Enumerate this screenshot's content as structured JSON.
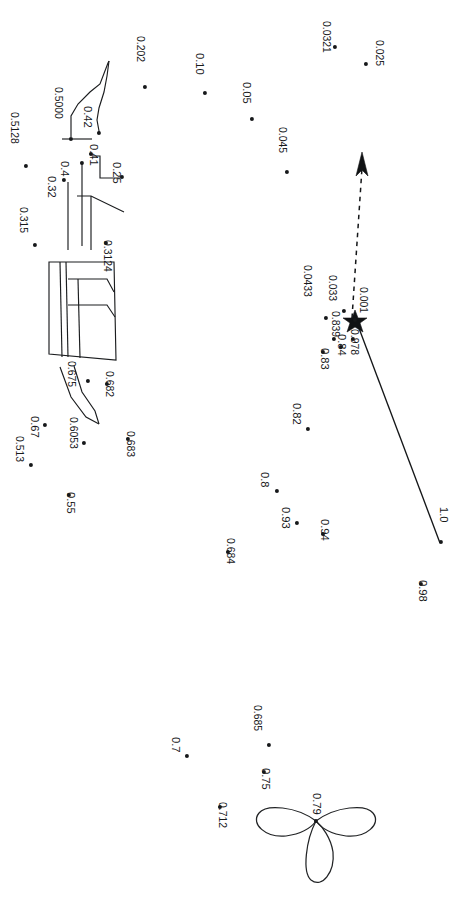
{
  "figure": {
    "title": "",
    "background_color": "#ffffff",
    "ink_color": "#18191b",
    "orientation_note": "labels rotated 90 degrees clockwise",
    "width": 476,
    "height": 899
  },
  "chart_data": {
    "type": "scatter",
    "title": "",
    "xlabel": "",
    "ylabel": "",
    "grid": false,
    "legend": null,
    "point_labels": [
      "0.025",
      "0.0321",
      "0.202",
      "0.10",
      "0.05",
      "0.045",
      "0.5000",
      "0.5128",
      "0.42",
      "0.41",
      "0.4",
      "0.32",
      "0.25",
      "0.315",
      "0.3124",
      "0.0433",
      "0.033",
      "0.001",
      "0.978",
      "0.84",
      "0.839",
      "0.83",
      "0.82",
      "0.8",
      "0.93",
      "0.94",
      "1.0",
      "0.98",
      "0.675",
      "0.682",
      "0.67",
      "0.6053",
      "0.513",
      "0.55",
      "0.683",
      "0.684",
      "0.685",
      "0.7",
      "0.75",
      "0.712",
      "0.79"
    ],
    "points": [
      {
        "label": "0.025",
        "x": 366,
        "y": 64,
        "lx": 384,
        "ly": 40
      },
      {
        "label": "0.0321",
        "x": 335,
        "y": 47,
        "lx": 331,
        "ly": 21
      },
      {
        "label": "0.202",
        "x": 145,
        "y": 87,
        "lx": 145,
        "ly": 36
      },
      {
        "label": "0.10",
        "x": 205,
        "y": 93,
        "lx": 205,
        "ly": 53
      },
      {
        "label": "0.05",
        "x": 252,
        "y": 119,
        "lx": 252,
        "ly": 82
      },
      {
        "label": "0.045",
        "x": 287,
        "y": 172,
        "lx": 287,
        "ly": 127
      },
      {
        "label": "0.5000",
        "x": 71,
        "y": 139,
        "lx": 63,
        "ly": 87
      },
      {
        "label": "0.5128",
        "x": 26,
        "y": 166,
        "lx": 19,
        "ly": 112
      },
      {
        "label": "0.42",
        "x": 99,
        "y": 133,
        "lx": 93,
        "ly": 106
      },
      {
        "label": "0.41",
        "x": 91,
        "y": 154,
        "lx": 99,
        "ly": 144
      },
      {
        "label": "0.4",
        "x": 82,
        "y": 163,
        "lx": 70,
        "ly": 161
      },
      {
        "label": "0.32",
        "x": 64,
        "y": 180,
        "lx": 57,
        "ly": 176
      },
      {
        "label": "0.25",
        "x": 122,
        "y": 177,
        "lx": 122,
        "ly": 162
      },
      {
        "label": "0.315",
        "x": 35,
        "y": 245,
        "lx": 28,
        "ly": 207
      },
      {
        "label": "0.3124",
        "x": 106,
        "y": 243,
        "lx": 112,
        "ly": 240
      },
      {
        "label": "0.0433",
        "x": 326,
        "y": 318,
        "lx": 312,
        "ly": 265
      },
      {
        "label": "0.033",
        "x": 344,
        "y": 311,
        "lx": 337,
        "ly": 275
      },
      {
        "label": "0.001",
        "x": 355,
        "y": 320,
        "lx": 368,
        "ly": 287
      },
      {
        "label": "0.978",
        "x": 353,
        "y": 339,
        "lx": 359,
        "ly": 329
      },
      {
        "label": "0.84",
        "x": 341,
        "y": 347,
        "lx": 347,
        "ly": 334
      },
      {
        "label": "0.839",
        "x": 334,
        "y": 339,
        "lx": 340,
        "ly": 311
      },
      {
        "label": "0.83",
        "x": 323,
        "y": 352,
        "lx": 330,
        "ly": 348
      },
      {
        "label": "0.82",
        "x": 308,
        "y": 429,
        "lx": 302,
        "ly": 403
      },
      {
        "label": "0.8",
        "x": 277,
        "y": 491,
        "lx": 270,
        "ly": 472
      },
      {
        "label": "0.93",
        "x": 297,
        "y": 523,
        "lx": 291,
        "ly": 507
      },
      {
        "label": "0.94",
        "x": 323,
        "y": 534,
        "lx": 330,
        "ly": 519
      },
      {
        "label": "1.0",
        "x": 441,
        "y": 542,
        "lx": 449,
        "ly": 507
      },
      {
        "label": "0.98",
        "x": 421,
        "y": 584,
        "lx": 428,
        "ly": 580
      },
      {
        "label": "0.675",
        "x": 88,
        "y": 381,
        "lx": 76,
        "ly": 361
      },
      {
        "label": "0.682",
        "x": 107,
        "y": 384,
        "lx": 114,
        "ly": 371
      },
      {
        "label": "0.67",
        "x": 45,
        "y": 425,
        "lx": 40,
        "ly": 416
      },
      {
        "label": "0.6053",
        "x": 84,
        "y": 443,
        "lx": 78,
        "ly": 417
      },
      {
        "label": "0.513",
        "x": 31,
        "y": 465,
        "lx": 24,
        "ly": 436
      },
      {
        "label": "0.55",
        "x": 69,
        "y": 495,
        "lx": 76,
        "ly": 492
      },
      {
        "label": "0.683",
        "x": 128,
        "y": 439,
        "lx": 135,
        "ly": 431
      },
      {
        "label": "0.684",
        "x": 228,
        "y": 552,
        "lx": 235,
        "ly": 538
      },
      {
        "label": "0.685",
        "x": 269,
        "y": 745,
        "lx": 262,
        "ly": 705
      },
      {
        "label": "0.7",
        "x": 187,
        "y": 756,
        "lx": 181,
        "ly": 737
      },
      {
        "label": "0.75",
        "x": 264,
        "y": 772,
        "lx": 271,
        "ly": 768
      },
      {
        "label": "0.712",
        "x": 220,
        "y": 807,
        "lx": 227,
        "ly": 802
      },
      {
        "label": "0.79",
        "x": 316,
        "y": 821,
        "lx": 322,
        "ly": 793
      }
    ],
    "markers": [
      {
        "name": "star-marker",
        "x": 355,
        "y": 320,
        "symbol": "star"
      }
    ],
    "annotations": [
      {
        "name": "dashed-arrow",
        "from": [
          352,
          321
        ],
        "to": [
          363,
          155
        ],
        "style": "dashed-with-arrowhead"
      },
      {
        "name": "solid-leader-line",
        "from": [
          356,
          322
        ],
        "to": [
          440,
          543
        ],
        "style": "solid"
      }
    ],
    "shapes": [
      {
        "name": "upper-hook-outline",
        "type": "polyline"
      },
      {
        "name": "mid-bracket-outline",
        "type": "polyline"
      },
      {
        "name": "quadrilateral-panel",
        "type": "polygon"
      },
      {
        "name": "lower-wedge-outline",
        "type": "polyline"
      },
      {
        "name": "trefoil-clover",
        "type": "closed-curve",
        "label": "0.79"
      }
    ]
  }
}
